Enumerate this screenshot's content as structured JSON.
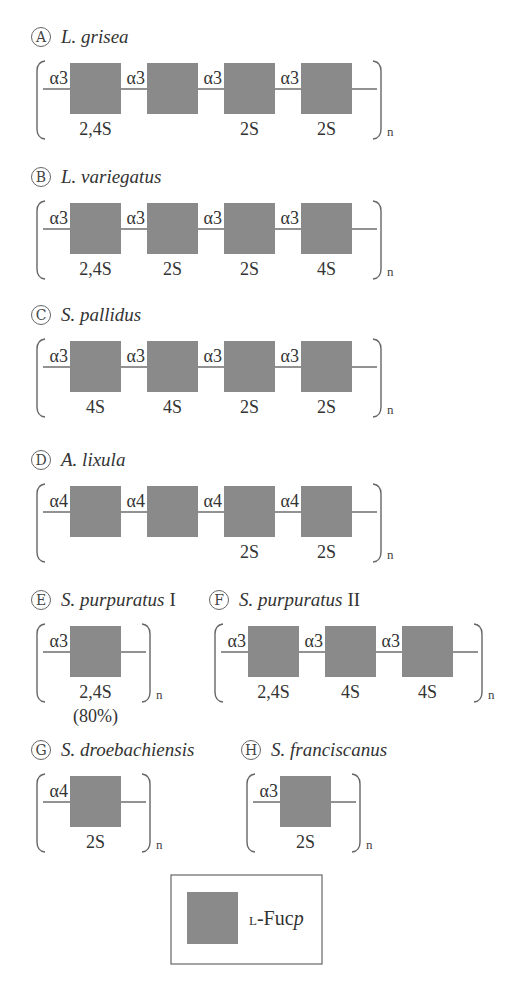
{
  "colors": {
    "fucose_square": "#8a8a8a",
    "line": "#6e6e6e",
    "text": "#333333"
  },
  "panels": [
    {
      "letter": "A",
      "species": "L. grisea",
      "suffix": "",
      "x": 32,
      "y": 37,
      "repeat": "n",
      "units": [
        {
          "linkage": "α3",
          "sulfation": "2,4S"
        },
        {
          "linkage": "α3",
          "sulfation": ""
        },
        {
          "linkage": "α3",
          "sulfation": "2S"
        },
        {
          "linkage": "α3",
          "sulfation": "2S"
        }
      ]
    },
    {
      "letter": "B",
      "species": "L. variegatus",
      "suffix": "",
      "x": 32,
      "y": 177,
      "repeat": "n",
      "units": [
        {
          "linkage": "α3",
          "sulfation": "2,4S"
        },
        {
          "linkage": "α3",
          "sulfation": "2S"
        },
        {
          "linkage": "α3",
          "sulfation": "2S"
        },
        {
          "linkage": "α3",
          "sulfation": "4S"
        }
      ]
    },
    {
      "letter": "C",
      "species": "S. pallidus",
      "suffix": "",
      "x": 32,
      "y": 315,
      "repeat": "n",
      "units": [
        {
          "linkage": "α3",
          "sulfation": "4S"
        },
        {
          "linkage": "α3",
          "sulfation": "4S"
        },
        {
          "linkage": "α3",
          "sulfation": "2S"
        },
        {
          "linkage": "α3",
          "sulfation": "2S"
        }
      ]
    },
    {
      "letter": "D",
      "species": "A. lixula",
      "suffix": "",
      "x": 32,
      "y": 460,
      "repeat": "n",
      "units": [
        {
          "linkage": "α4",
          "sulfation": ""
        },
        {
          "linkage": "α4",
          "sulfation": ""
        },
        {
          "linkage": "α4",
          "sulfation": "2S"
        },
        {
          "linkage": "α4",
          "sulfation": "2S"
        }
      ]
    },
    {
      "letter": "E",
      "species": "S. purpuratus",
      "suffix": "I",
      "x": 32,
      "y": 600,
      "repeat": "n",
      "note": "(80%)",
      "units": [
        {
          "linkage": "α3",
          "sulfation": "2,4S"
        }
      ]
    },
    {
      "letter": "F",
      "species": "S. purpuratus",
      "suffix": "II",
      "x": 210,
      "y": 600,
      "repeat": "n",
      "units": [
        {
          "linkage": "α3",
          "sulfation": "2,4S"
        },
        {
          "linkage": "α3",
          "sulfation": "4S"
        },
        {
          "linkage": "α3",
          "sulfation": "4S"
        }
      ]
    },
    {
      "letter": "G",
      "species": "S. droebachiensis",
      "suffix": "",
      "x": 32,
      "y": 750,
      "repeat": "n",
      "units": [
        {
          "linkage": "α4",
          "sulfation": "2S"
        }
      ]
    },
    {
      "letter": "H",
      "species": "S. franciscanus",
      "suffix": "",
      "x": 242,
      "y": 750,
      "repeat": "n",
      "units": [
        {
          "linkage": "α3",
          "sulfation": "2S"
        }
      ]
    }
  ],
  "legend": {
    "prefix": "L",
    "label": "-Fuc",
    "label_italic": "p"
  }
}
